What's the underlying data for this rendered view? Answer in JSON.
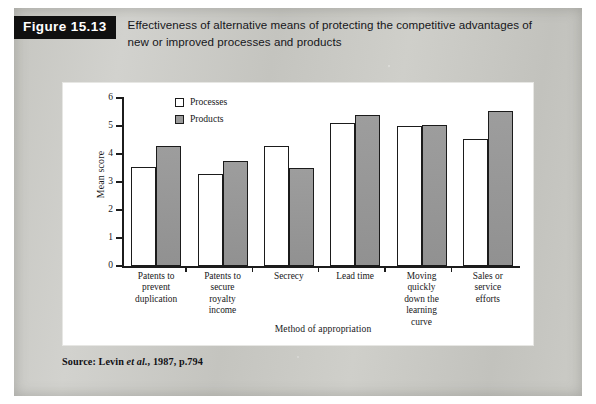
{
  "figure": {
    "badge_label": "Figure 15.13",
    "title": "Effectiveness of alternative means of protecting the competitive advantages of new or improved processes and products",
    "source_prefix": "Source: Levin ",
    "source_italic": "et al.",
    "source_suffix": ", 1987, p.794"
  },
  "colors": {
    "page_background": "#c9c9c4",
    "panel_background": "#ffffff",
    "badge_background": "#101010",
    "badge_text": "#ffffff",
    "axis": "#1c1c1c",
    "processes_fill": "#ffffff",
    "products_fill": "#9a9a9a",
    "text": "#18181a"
  },
  "chart_data": {
    "type": "bar",
    "title": "Effectiveness of alternative means of protecting the competitive advantages of new or improved processes and products",
    "xlabel": "Method of appropriation",
    "ylabel": "Mean score",
    "ylim": [
      0,
      6
    ],
    "yticks": [
      0,
      1,
      2,
      3,
      4,
      5,
      6
    ],
    "ytick_labels": [
      "0",
      "1",
      "2",
      "3",
      "4",
      "5",
      "6"
    ],
    "grid": false,
    "legend_position": "top-left-inside",
    "categories": [
      "Patents to prevent duplication",
      "Patents to secure royalty income",
      "Secrecy",
      "Lead time",
      "Moving quickly down the learning curve",
      "Sales or service efforts"
    ],
    "category_lines": [
      [
        "Patents to",
        "prevent",
        "duplication"
      ],
      [
        "Patents to",
        "secure",
        "royalty",
        "income"
      ],
      [
        "Secrecy"
      ],
      [
        "Lead time"
      ],
      [
        "Moving",
        "quickly",
        "down the",
        "learning",
        "curve"
      ],
      [
        "Sales or",
        "service",
        "efforts"
      ]
    ],
    "series": [
      {
        "name": "Processes",
        "values": [
          3.55,
          3.3,
          4.3,
          5.1,
          5.0,
          4.55
        ]
      },
      {
        "name": "Products",
        "values": [
          4.3,
          3.75,
          3.5,
          5.4,
          5.05,
          5.55
        ]
      }
    ]
  }
}
